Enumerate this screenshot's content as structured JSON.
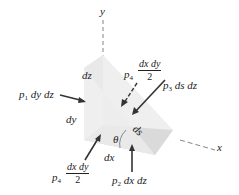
{
  "figure": {
    "type": "free-body diagram of a wedge-shaped fluid element",
    "axes": {
      "y": "y",
      "x": "x"
    },
    "dimensions": {
      "dz": "dz",
      "dy": "dy",
      "dx": "dx",
      "ds": "ds"
    },
    "angle": "θ",
    "forces": {
      "p1": {
        "symbol": "p",
        "sub": "1",
        "expr": "dy dz"
      },
      "p2": {
        "symbol": "p",
        "sub": "2",
        "expr": "dx dz"
      },
      "p3": {
        "symbol": "p",
        "sub": "3",
        "expr": "ds dz"
      },
      "p4_top": {
        "symbol": "p",
        "sub": "4",
        "num": "dx dy",
        "den": "2"
      },
      "p4_bottom": {
        "symbol": "p",
        "sub": "4",
        "num": "dx dy",
        "den": "2"
      }
    },
    "colors": {
      "face_light": "#f2f2f2",
      "face_mid": "#e6e6e6",
      "face_dark": "#d6d6d6",
      "arrow": "#333333",
      "axis": "#555555"
    }
  }
}
